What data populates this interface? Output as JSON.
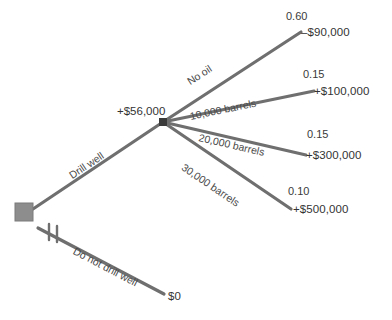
{
  "diagram": {
    "type": "decision-tree",
    "colors": {
      "branch_line": "#6f6f6f",
      "decision_node": "#8d8d8d",
      "chance_node": "#3a3a3a",
      "text": "#3a3a3a"
    },
    "decision_node": {
      "name": "decision-node",
      "expected_value": ""
    },
    "chance_node": {
      "name": "chance-node",
      "expected_value": "+$56,000"
    },
    "decision_branches": [
      {
        "label": "Drill well",
        "pruned": false
      },
      {
        "label": "Do not drill well",
        "pruned": true,
        "payoff": "$0"
      }
    ],
    "outcome_branches": [
      {
        "label": "No oil",
        "probability": "0.60",
        "payoff": "–$90,000"
      },
      {
        "label": "10,000 barrels",
        "probability": "0.15",
        "payoff": "+$100,000"
      },
      {
        "label": "20,000 barrels",
        "probability": "0.15",
        "payoff": "+$300,000"
      },
      {
        "label": "30,000 barrels",
        "probability": "0.10",
        "payoff": "+$500,000"
      }
    ]
  }
}
